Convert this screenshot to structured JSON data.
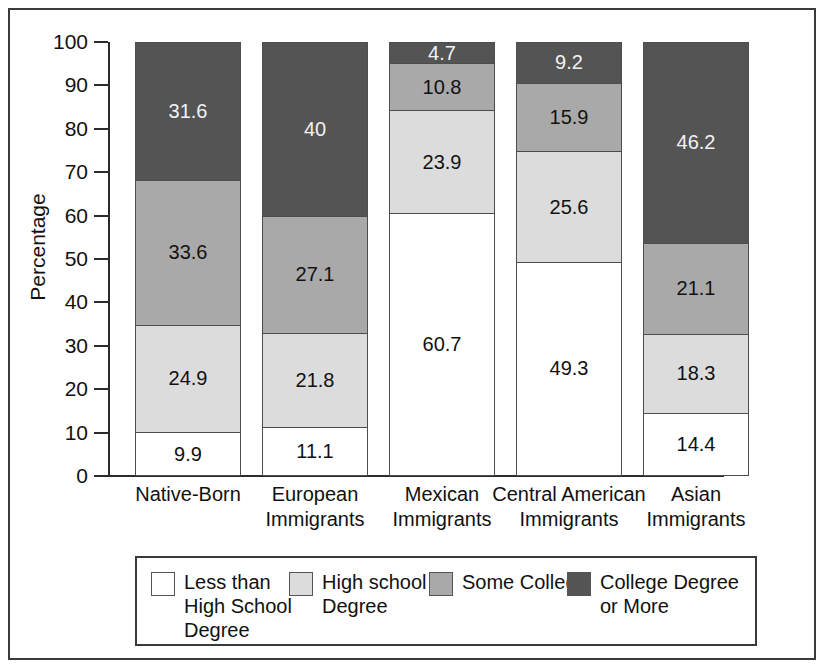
{
  "chart_data": {
    "type": "bar",
    "subtype": "stacked-bar-100",
    "title": "",
    "xlabel": "",
    "ylabel": "Percentage",
    "ylim": [
      0,
      100
    ],
    "yticks": [
      100,
      90,
      80,
      70,
      60,
      50,
      40,
      30,
      20,
      10,
      0
    ],
    "grid": false,
    "legend_position": "bottom",
    "categories": [
      "Native-Born",
      "European\nImmigrants",
      "Mexican\nImmigrants",
      "Central American\nImmigrants",
      "Asian\nImmigrants"
    ],
    "series": [
      {
        "name": "Less than\nHigh School\nDegree",
        "color": "#ffffff",
        "values": [
          9.9,
          11.1,
          60.7,
          49.3,
          14.4
        ],
        "labels": [
          "9.9",
          "11.1",
          "60.7",
          "49.3",
          "14.4"
        ]
      },
      {
        "name": "High school\nDegree",
        "color": "#dcdcdc",
        "values": [
          24.9,
          21.8,
          23.9,
          25.6,
          18.3
        ],
        "labels": [
          "24.9",
          "21.8",
          "23.9",
          "25.6",
          "18.3"
        ]
      },
      {
        "name": "Some College",
        "color": "#a9a9a9",
        "values": [
          33.6,
          27.1,
          10.8,
          15.9,
          21.1
        ],
        "labels": [
          "33.6",
          "27.1",
          "10.8",
          "15.9",
          "21.1"
        ]
      },
      {
        "name": "College Degree\nor More",
        "color": "#545454",
        "values": [
          31.6,
          40.0,
          4.7,
          9.2,
          46.2
        ],
        "labels": [
          "31.6",
          "40",
          "4.7",
          "9.2",
          "46.2"
        ]
      }
    ]
  }
}
